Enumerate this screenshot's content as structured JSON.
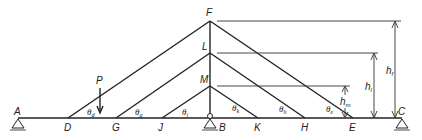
{
  "diagram": {
    "type": "structural-influence-geometry",
    "nodes": {
      "A": {
        "label": "A",
        "x": 18,
        "y": 118
      },
      "D": {
        "label": "D",
        "x": 68,
        "y": 118
      },
      "G": {
        "label": "G",
        "x": 116,
        "y": 118
      },
      "J": {
        "label": "J",
        "x": 162,
        "y": 118
      },
      "B": {
        "label": "B",
        "x": 210,
        "y": 118
      },
      "K": {
        "label": "K",
        "x": 258,
        "y": 118
      },
      "H": {
        "label": "H",
        "x": 305,
        "y": 118
      },
      "E": {
        "label": "E",
        "x": 353,
        "y": 118
      },
      "C": {
        "label": "C",
        "x": 402,
        "y": 118
      },
      "F": {
        "label": "F",
        "x": 210,
        "y": 21
      },
      "L": {
        "label": "L",
        "x": 210,
        "y": 53
      },
      "M": {
        "label": "M",
        "x": 210,
        "y": 86
      }
    },
    "load": {
      "label": "P"
    },
    "angles": {
      "d": {
        "symbol": "θ",
        "sub": "d"
      },
      "g": {
        "symbol": "θ",
        "sub": "g"
      },
      "j": {
        "symbol": "θ",
        "sub": "j"
      },
      "k": {
        "symbol": "θ",
        "sub": "k"
      },
      "h": {
        "symbol": "θ",
        "sub": "h"
      },
      "e": {
        "symbol": "θ",
        "sub": "e"
      }
    },
    "dimensions": {
      "hf": {
        "symbol": "h",
        "sub": "f"
      },
      "hl": {
        "symbol": "h",
        "sub": "l"
      },
      "hm": {
        "symbol": "h",
        "sub": "m"
      }
    }
  }
}
